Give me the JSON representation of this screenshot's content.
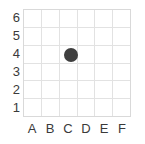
{
  "chart_data": {
    "type": "scatter",
    "title": "",
    "subtitle": "",
    "xlabel": "",
    "ylabel": "",
    "categories": [
      "A",
      "B",
      "C",
      "D",
      "E",
      "F"
    ],
    "y_ticks": [
      6,
      5,
      4,
      3,
      2,
      1
    ],
    "y_ticks_bottom_to_top": [
      1,
      2,
      3,
      4,
      5,
      6
    ],
    "ylim": [
      0,
      6
    ],
    "xlim_categories": 6,
    "grid": true,
    "grid_color": "#e2e2e2",
    "border_color": "#d9d9d9",
    "background_color": "#ffffff",
    "legend": null,
    "legend_position": "none",
    "points": [
      {
        "x": "C",
        "y": 4,
        "color": "#3f3f3f",
        "radius_px": 7,
        "label": ""
      }
    ],
    "series": [
      {
        "name": "point",
        "marker": "circle",
        "color": "#3f3f3f",
        "x": [
          "C"
        ],
        "values": [
          4
        ]
      }
    ]
  },
  "axes": {
    "y_labels": [
      "6",
      "5",
      "4",
      "3",
      "2",
      "1"
    ],
    "x_labels": [
      "A",
      "B",
      "C",
      "D",
      "E",
      "F"
    ]
  },
  "colors": {
    "marker": "#3f3f3f",
    "grid": "#e2e2e2",
    "border": "#d9d9d9",
    "text": "#3a3a3a",
    "background": "#ffffff"
  }
}
